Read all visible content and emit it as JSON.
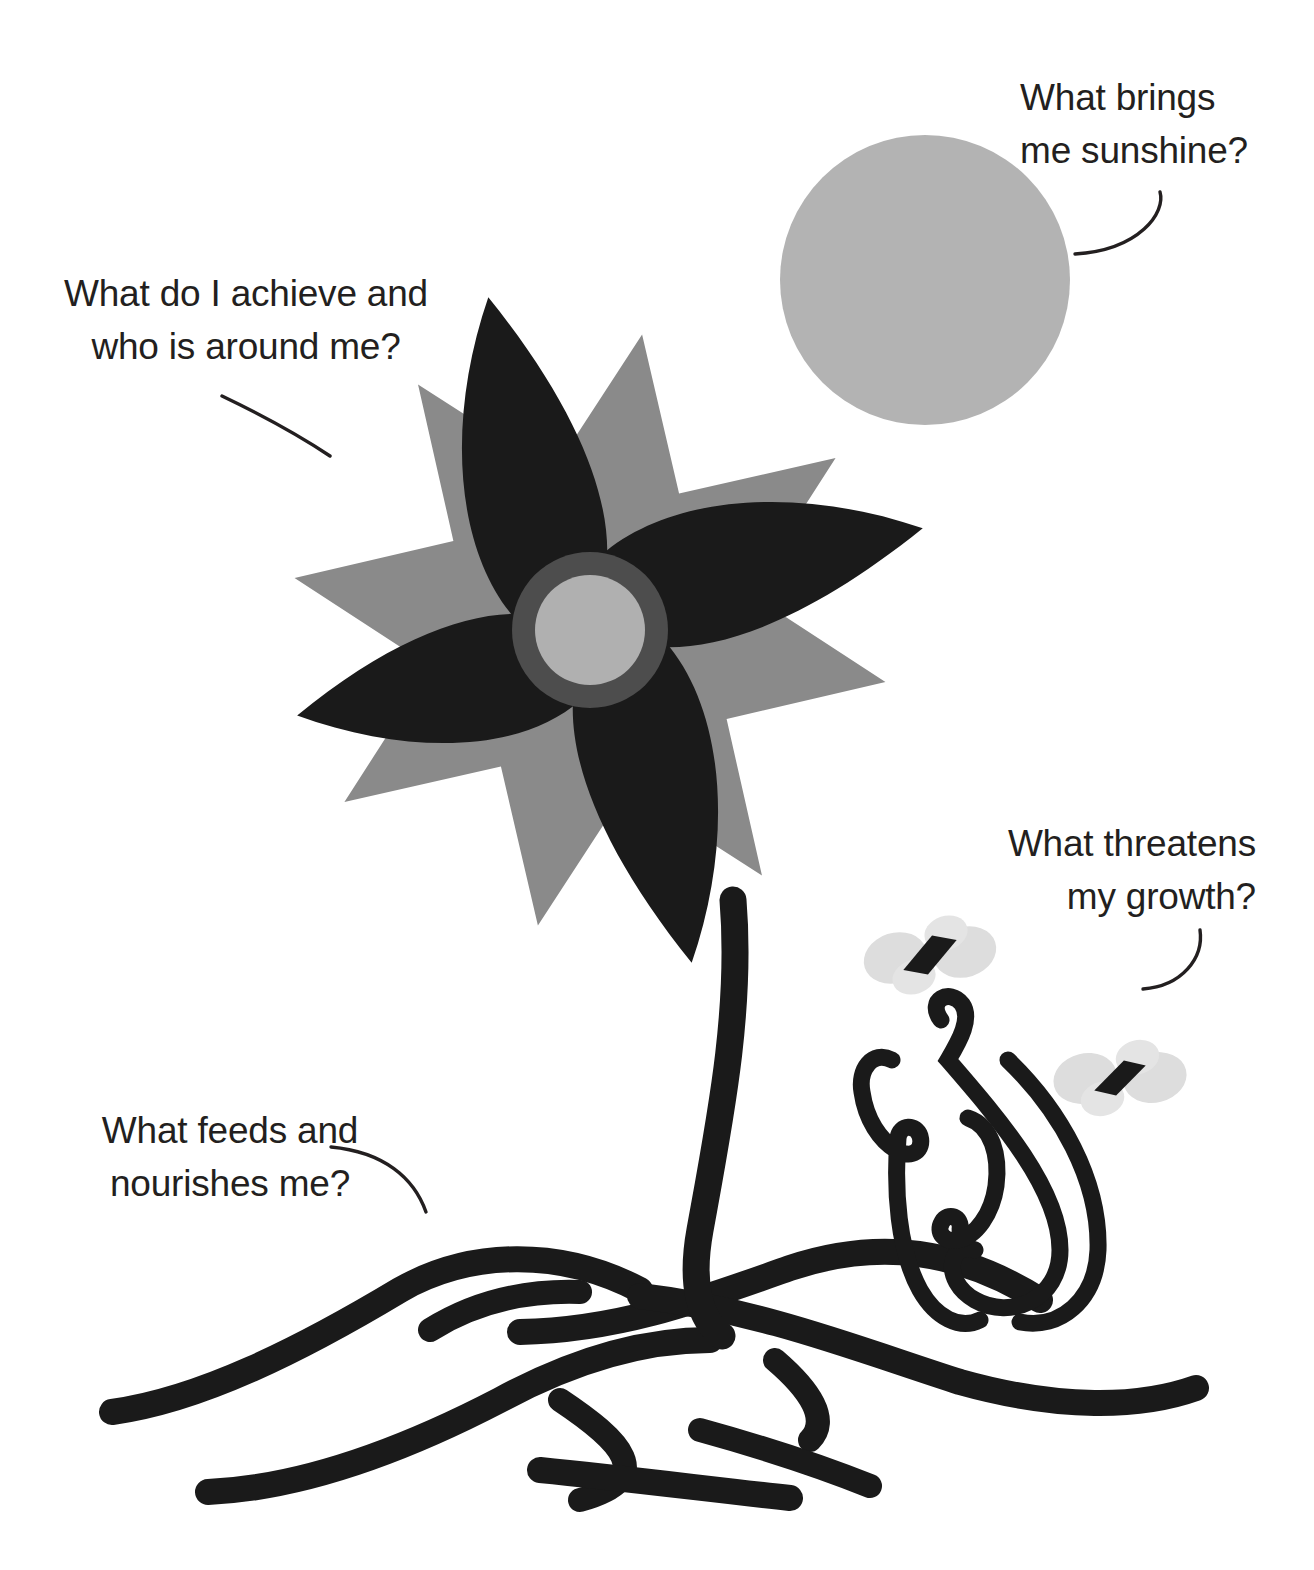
{
  "page": {
    "background_color": "#ffffff",
    "width": 1314,
    "height": 1570
  },
  "colors": {
    "ink": "#231f20",
    "petal_dark": "#1a1a1a",
    "star_gray": "#8a8a8a",
    "sun_gray": "#b3b3b3",
    "center_ring": "#4d4d4d",
    "center_fill": "#b0b0b0",
    "wing_gray": "#dcdcdc",
    "stem_black": "#1a1a1a"
  },
  "labels": {
    "sunshine": {
      "text": "What brings\nme sunshine?",
      "points_to": "sun"
    },
    "achieve": {
      "text": "What do I achieve and\nwho is around me?",
      "points_to": "flower-petals"
    },
    "threat": {
      "text": "What threatens\nmy growth?",
      "points_to": "weeds-and-pests"
    },
    "feeds": {
      "text": "What feeds and\nnourishes me?",
      "points_to": "roots"
    }
  },
  "illustration": {
    "sun": {
      "name": "sun-circle",
      "cx": 925,
      "cy": 280,
      "r": 145,
      "fill": "#b3b3b3"
    },
    "flower": {
      "name": "flower-head",
      "cx": 590,
      "cy": 630,
      "petal_count": 4,
      "star_points": 8,
      "center_outer_r": 78,
      "center_inner_r": 55
    },
    "stem": {
      "name": "flower-stem",
      "thickness": 26
    },
    "roots": {
      "name": "root-system",
      "branch_count": 9,
      "thickness": 24
    },
    "weeds": {
      "name": "weed-tendrils",
      "count": 4,
      "thickness": 16
    },
    "pests": [
      {
        "name": "butterfly-pest",
        "cx": 930,
        "cy": 955
      },
      {
        "name": "butterfly-pest",
        "cx": 1120,
        "cy": 1078
      }
    ]
  }
}
